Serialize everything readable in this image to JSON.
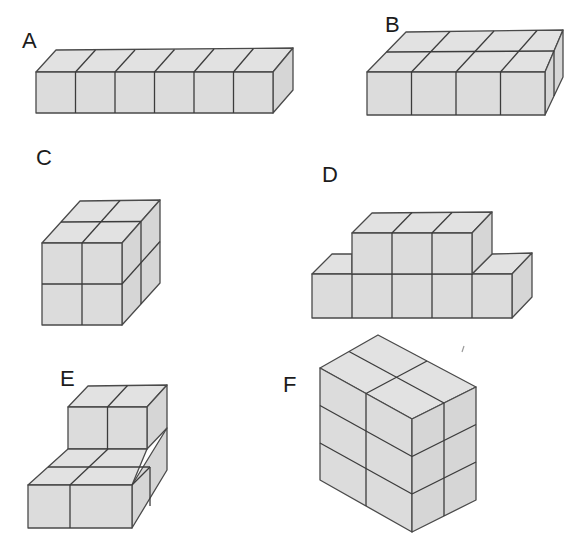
{
  "figures": [
    {
      "label": "A",
      "description": "Row of 6 cubes (6 x 1 x 1)",
      "cube_count": 6
    },
    {
      "label": "B",
      "description": "Slab of 8 cubes (4 wide x 2 deep x 1 high)",
      "cube_count": 8
    },
    {
      "label": "C",
      "description": "Cube of 8 cubes (2 x 2 x 2)",
      "cube_count": 8
    },
    {
      "label": "D",
      "description": "5 cubes in a row with 3 cubes stacked on the middle",
      "cube_count": 8
    },
    {
      "label": "E",
      "description": "2 x 2 base with 2 cubes stacked on the back row",
      "cube_count": 6
    },
    {
      "label": "F",
      "description": "Block of 12 cubes (2 x 2 x 3)",
      "cube_count": 12
    }
  ],
  "colors": {
    "cube_fill": "#dcdcdc",
    "cube_edge": "#4a4a4a",
    "label": "#1c1c1c",
    "background": "#ffffff"
  }
}
